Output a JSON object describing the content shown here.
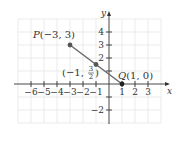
{
  "diagram": {
    "type": "coordinate-plane",
    "axes": {
      "x_label": "x",
      "y_label": "y",
      "x_ticks": [
        "−6",
        "−5",
        "−4",
        "−3",
        "−2",
        "−1",
        "1",
        "2",
        "3"
      ],
      "y_ticks": [
        "4",
        "3",
        "2",
        "−2"
      ]
    },
    "points": [
      {
        "name": "P",
        "label_prefix": "P",
        "label_coords": "(−3, 3)",
        "x": -3,
        "y": 3
      },
      {
        "name": "midpoint",
        "label_open": "(−1, ",
        "frac_num": "3",
        "frac_den": "2",
        "label_close": ")",
        "x": -1,
        "y": 1.5
      },
      {
        "name": "Q",
        "label_prefix": "Q",
        "label_coords": "(1, 0)",
        "x": 1,
        "y": 0
      }
    ],
    "segment": {
      "from": "P",
      "to": "Q"
    },
    "colors": {
      "grid": "#e6e6e6",
      "axis": "#333333",
      "segment": "#666666",
      "point": "#555555",
      "point_q": "#222222"
    }
  }
}
